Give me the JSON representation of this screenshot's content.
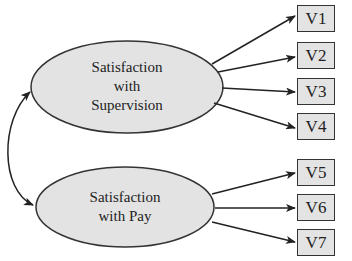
{
  "diagram": {
    "type": "structural-equation-model",
    "latent_factors": [
      {
        "id": "F1",
        "label_lines": [
          "Satisfaction",
          "with",
          "Supervision"
        ],
        "indicators": [
          "V1",
          "V2",
          "V3",
          "V4"
        ]
      },
      {
        "id": "F2",
        "label_lines": [
          "Satisfaction",
          "with Pay"
        ],
        "indicators": [
          "V5",
          "V6",
          "V7"
        ]
      }
    ],
    "observed_variables": [
      "V1",
      "V2",
      "V3",
      "V4",
      "V5",
      "V6",
      "V7"
    ],
    "covariance": {
      "between": [
        "F1",
        "F2"
      ],
      "arrow": "double-headed curved"
    },
    "colors": {
      "fill": "#e3e3e3",
      "stroke": "#333333",
      "background": "#ffffff"
    }
  }
}
